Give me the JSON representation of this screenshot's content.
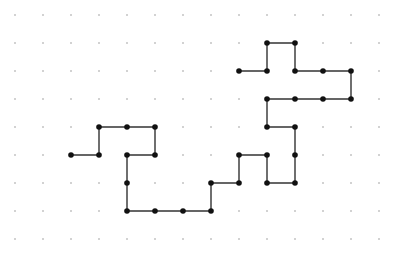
{
  "diagram": {
    "type": "lattice-path",
    "grid": {
      "origin_x": 15,
      "origin_y": 15,
      "spacing": 28,
      "columns": 14,
      "rows": 9,
      "dot_color": "#9a9a9a",
      "dot_radius": 0.8
    },
    "path": {
      "line_color": "#333333",
      "line_width": 1.4,
      "node_color": "#111111",
      "node_radius": 2.8,
      "points": [
        [
          2,
          5
        ],
        [
          3,
          5
        ],
        [
          3,
          4
        ],
        [
          4,
          4
        ],
        [
          5,
          4
        ],
        [
          5,
          5
        ],
        [
          4,
          5
        ],
        [
          4,
          6
        ],
        [
          4,
          7
        ],
        [
          5,
          7
        ],
        [
          6,
          7
        ],
        [
          7,
          7
        ],
        [
          7,
          6
        ],
        [
          8,
          6
        ],
        [
          8,
          5
        ],
        [
          9,
          5
        ],
        [
          9,
          6
        ],
        [
          10,
          6
        ],
        [
          10,
          5
        ],
        [
          10,
          4
        ],
        [
          9,
          4
        ],
        [
          9,
          3
        ],
        [
          10,
          3
        ],
        [
          11,
          3
        ],
        [
          12,
          3
        ],
        [
          12,
          2
        ],
        [
          11,
          2
        ],
        [
          10,
          2
        ],
        [
          10,
          1
        ],
        [
          9,
          1
        ],
        [
          9,
          2
        ],
        [
          8,
          2
        ]
      ]
    }
  }
}
